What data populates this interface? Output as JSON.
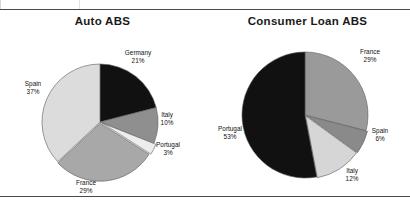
{
  "figure": {
    "panels": [
      {
        "title": "Auto ABS"
      },
      {
        "title": "Consumer Loan ABS"
      }
    ]
  },
  "chart_data": [
    {
      "type": "pie",
      "title": "Auto ABS",
      "labels": [
        "Germany",
        "Italy",
        "Portugal",
        "France",
        "Spain"
      ],
      "values": [
        21,
        10,
        3,
        29,
        37
      ],
      "value_suffix": "%",
      "slice_colors": [
        "#111111",
        "#8f8f8f",
        "#ededed",
        "#a8a8a8",
        "#dcdcdc"
      ],
      "start_angle": 0,
      "direction": "clockwise",
      "legend": "none",
      "grid": false,
      "data_labels": [
        {
          "label": "Germany",
          "value": 21,
          "text": "21%"
        },
        {
          "label": "Italy",
          "value": 10,
          "text": "10%"
        },
        {
          "label": "Portugal",
          "value": 3,
          "text": "3%"
        },
        {
          "label": "France",
          "value": 29,
          "text": "29%"
        },
        {
          "label": "Spain",
          "value": 37,
          "text": "37%"
        }
      ]
    },
    {
      "type": "pie",
      "title": "Consumer Loan ABS",
      "labels": [
        "France",
        "Spain",
        "Italy",
        "Portugal"
      ],
      "values": [
        29,
        6,
        12,
        53
      ],
      "value_suffix": "%",
      "slice_colors": [
        "#9a9a9a",
        "#8a8a8a",
        "#d6d6d6",
        "#111111"
      ],
      "start_angle": 0,
      "direction": "clockwise",
      "legend": "none",
      "grid": false,
      "data_labels": [
        {
          "label": "France",
          "value": 29,
          "text": "29%"
        },
        {
          "label": "Spain",
          "value": 6,
          "text": "6%"
        },
        {
          "label": "Italy",
          "value": 12,
          "text": "12%"
        },
        {
          "label": "Portugal",
          "value": 53,
          "text": "53%"
        }
      ]
    }
  ]
}
